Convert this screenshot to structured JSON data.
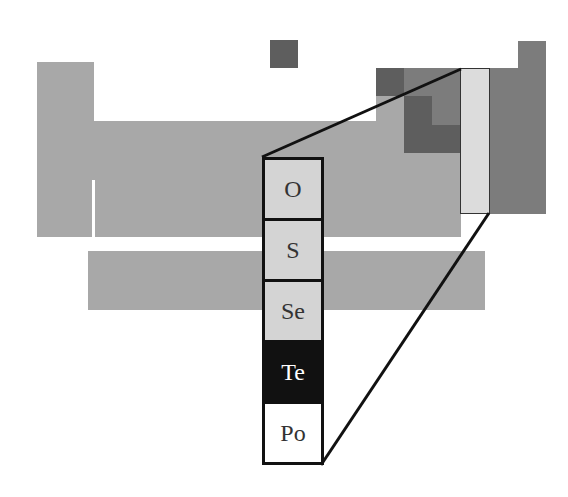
{
  "figure": {
    "highlighted_group": "Group 16",
    "colors": {
      "main_table": "#a8a8a8",
      "nonmetal_region": "#7c7c7c",
      "dark_region": "#5e5e5e",
      "highlight_column": "#dcdcdc",
      "outline": "#111111"
    }
  },
  "column": {
    "elements": [
      {
        "symbol": "O",
        "bg": "#d4d4d4",
        "fg": "#333333"
      },
      {
        "symbol": "S",
        "bg": "#d4d4d4",
        "fg": "#333333"
      },
      {
        "symbol": "Se",
        "bg": "#d4d4d4",
        "fg": "#333333"
      },
      {
        "symbol": "Te",
        "bg": "#111111",
        "fg": "#ffffff"
      },
      {
        "symbol": "Po",
        "bg": "#ffffff",
        "fg": "#333333"
      }
    ]
  }
}
